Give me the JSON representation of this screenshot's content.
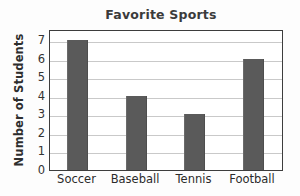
{
  "chart_data": {
    "type": "bar",
    "title": "Favorite Sports",
    "xlabel": "",
    "ylabel": "Number of Students",
    "categories": [
      "Soccer",
      "Baseball",
      "Tennis",
      "Football"
    ],
    "values": [
      7,
      4,
      3,
      6
    ],
    "ylim": [
      0,
      7.6
    ],
    "yticks": [
      0,
      1,
      2,
      3,
      4,
      5,
      6,
      7
    ],
    "ytick_labels": [
      "0",
      "1",
      "2",
      "3",
      "4",
      "5",
      "6",
      "7"
    ],
    "grid": "horizontal",
    "legend": "none",
    "colors": {
      "bar": "#5a5a5a",
      "grid": "#c9c9c9",
      "frame": "#3d3d3d",
      "title": "#3b3b3b",
      "text": "#2b2b2b",
      "background": "#ffffff"
    }
  }
}
